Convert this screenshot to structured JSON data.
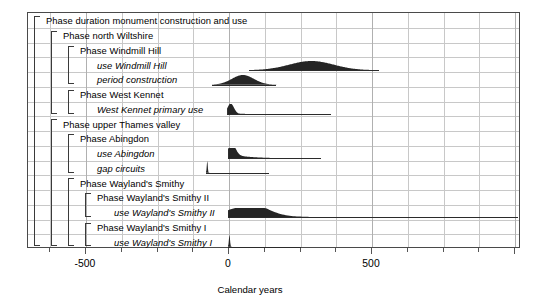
{
  "chart_data": {
    "type": "bar",
    "title": "",
    "xlabel": "Calendar years",
    "ylabel": "",
    "xlim": [
      -800,
      1020
    ],
    "xticks": [
      -500,
      0,
      500
    ],
    "xticklabels": [
      "-500",
      "0",
      "500"
    ],
    "grid": true,
    "legend": null,
    "rows": [
      {
        "label": "Phase duration monument construction and use",
        "kind": "phase",
        "depth": 0,
        "dist": null
      },
      {
        "label": "Phase north Wiltshire",
        "kind": "phase",
        "depth": 1,
        "dist": null
      },
      {
        "label": "Phase Windmill Hill",
        "kind": "phase",
        "depth": 2,
        "dist": null
      },
      {
        "label": "use Windmill Hill",
        "kind": "distribution",
        "depth": 3,
        "dist": {
          "peak": 322,
          "start": 70,
          "end": 525,
          "shape": "broad-symmetric",
          "height": 0.78
        }
      },
      {
        "label": "period construction",
        "kind": "distribution",
        "depth": 3,
        "dist": {
          "peak": 15,
          "start": -60,
          "end": 165,
          "shape": "broad-symmetric",
          "height": 0.82
        }
      },
      {
        "label": "Phase West Kennet",
        "kind": "phase",
        "depth": 2,
        "dist": null
      },
      {
        "label": "West Kennet primary use",
        "kind": "distribution",
        "depth": 3,
        "dist": {
          "peak": 5,
          "start": -8,
          "end": 358,
          "shape": "sharp-right-tail",
          "height": 0.85
        }
      },
      {
        "label": "Phase upper Thames valley",
        "kind": "phase",
        "depth": 1,
        "dist": null
      },
      {
        "label": "Phase Abingdon",
        "kind": "phase",
        "depth": 2,
        "dist": null
      },
      {
        "label": "use Abingdon",
        "kind": "distribution",
        "depth": 3,
        "dist": {
          "peak": 8,
          "start": -5,
          "end": 320,
          "shape": "sharp-long-tail",
          "height": 0.9
        }
      },
      {
        "label": "gap circuits",
        "kind": "distribution",
        "depth": 3,
        "dist": {
          "peak": 0,
          "start": -82,
          "end": 140,
          "shape": "spike",
          "height": 1.0
        }
      },
      {
        "label": "Phase Wayland's Smithy",
        "kind": "phase",
        "depth": 2,
        "dist": null
      },
      {
        "label": "Phase Wayland's Smithy II",
        "kind": "phase",
        "depth": 3,
        "dist": null
      },
      {
        "label": "use Wayland's Smithy II",
        "kind": "distribution",
        "depth": 4,
        "dist": {
          "peak": 78,
          "start": -2,
          "end": 1010,
          "shape": "broad-long-tail",
          "height": 0.8
        }
      },
      {
        "label": "Phase Wayland's Smithy I",
        "kind": "phase",
        "depth": 3,
        "dist": null
      },
      {
        "label": "use Wayland's Smithy I",
        "kind": "distribution",
        "depth": 4,
        "dist": {
          "peak": 0,
          "start": -4,
          "end": 252,
          "shape": "spike",
          "height": 1.0
        }
      }
    ],
    "brackets": [
      {
        "name": "monument-construction-and-use",
        "depth": 0,
        "from_row": 0,
        "to_row": 15
      },
      {
        "name": "north-wiltshire",
        "depth": 1,
        "from_row": 1,
        "to_row": 6
      },
      {
        "name": "windmill-hill",
        "depth": 2,
        "from_row": 2,
        "to_row": 4
      },
      {
        "name": "west-kennet",
        "depth": 2,
        "from_row": 5,
        "to_row": 6
      },
      {
        "name": "upper-thames-valley",
        "depth": 1,
        "from_row": 7,
        "to_row": 15
      },
      {
        "name": "abingdon",
        "depth": 2,
        "from_row": 8,
        "to_row": 10
      },
      {
        "name": "waylands-smithy",
        "depth": 2,
        "from_row": 11,
        "to_row": 15
      },
      {
        "name": "waylands-smithy-ii",
        "depth": 3,
        "from_row": 12,
        "to_row": 13
      },
      {
        "name": "waylands-smithy-i",
        "depth": 3,
        "from_row": 14,
        "to_row": 15
      }
    ]
  },
  "colors": {
    "distribution_fill": "#252525",
    "range_bar": "#2b2b2b",
    "grid": "#c8c8c8",
    "frame": "#4a4a4a",
    "bracket": "#3a3a3a",
    "text": "#000000",
    "background": "#ffffff"
  }
}
